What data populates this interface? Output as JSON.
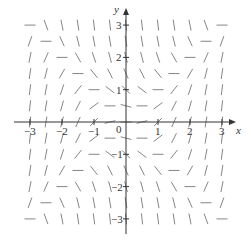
{
  "diagram": {
    "type": "slope_field",
    "equation": "dy/dx = x^2 - y^2",
    "axes": {
      "x_label": "x",
      "y_label": "y",
      "x_ticks": [
        "-3",
        "-2",
        "-1",
        "0",
        "1",
        "2",
        "3"
      ],
      "y_ticks": [
        "3",
        "2",
        "1",
        "-1",
        "-2",
        "-3"
      ],
      "x_range": [
        -3,
        3
      ],
      "y_range": [
        -3,
        3
      ],
      "origin_label": "0"
    },
    "grid_step": 0.5,
    "colors": {
      "axis": "#333333",
      "segment": "#777777",
      "background": "#ffffff"
    }
  }
}
